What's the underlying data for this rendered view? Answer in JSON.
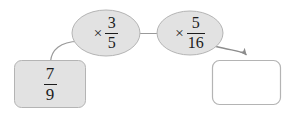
{
  "diagram": {
    "type": "function-machine-flow",
    "background_color": "#ffffff",
    "nodes": [
      {
        "id": "input-box",
        "shape": "rounded-rect",
        "role": "input-value",
        "fill_color": "#e2e2e2",
        "stroke_color": "#b4b4b4",
        "value_label": "7/9",
        "numerator": "7",
        "denominator": "9",
        "x": 14,
        "y": 60,
        "w": 72,
        "h": 48
      },
      {
        "id": "operation-1",
        "shape": "ellipse",
        "role": "operation",
        "fill_color": "#e2e2e2",
        "stroke_color": "#b4b4b4",
        "operator": "×",
        "numerator": "3",
        "denominator": "5",
        "label": "× 3/5",
        "cx": 106,
        "cy": 33,
        "rx": 34,
        "ry": 23
      },
      {
        "id": "operation-2",
        "shape": "ellipse",
        "role": "operation",
        "fill_color": "#e2e2e2",
        "stroke_color": "#b4b4b4",
        "operator": "×",
        "numerator": "5",
        "denominator": "16",
        "label": "× 5/16",
        "cx": 190,
        "cy": 33,
        "rx": 33,
        "ry": 22
      },
      {
        "id": "output-box",
        "shape": "rounded-rect",
        "role": "answer-blank",
        "fill_color": "#ffffff",
        "stroke_color": "#b4b4b4",
        "value_label": "",
        "x": 212,
        "y": 60,
        "w": 69,
        "h": 45
      }
    ],
    "connectors": [
      {
        "id": "connector-input-to-op1",
        "from": "input-box",
        "to": "operation-1",
        "style": "curved-line",
        "arrowhead": false,
        "stroke_color": "#9a9a9a"
      },
      {
        "id": "connector-op1-to-op2",
        "from": "operation-1",
        "to": "operation-2",
        "style": "straight-line",
        "arrowhead": false,
        "stroke_color": "#9a9a9a"
      },
      {
        "id": "connector-op2-to-output",
        "from": "operation-2",
        "to": "output-box",
        "style": "curved-arrow",
        "arrowhead": true,
        "stroke_color": "#8c8c8c"
      }
    ]
  }
}
